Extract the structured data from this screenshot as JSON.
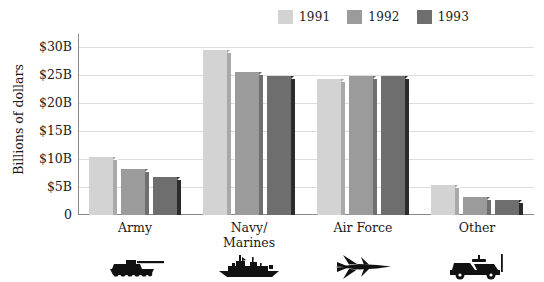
{
  "chart_data": {
    "type": "bar",
    "title": "",
    "subtitle": "",
    "xlabel": "",
    "ylabel": "Billions of dollars",
    "categories": [
      "Army",
      "Navy/\nMarines",
      "Air Force",
      "Other"
    ],
    "category_lines": [
      [
        "Army"
      ],
      [
        "Navy/",
        "Marines"
      ],
      [
        "Air Force"
      ],
      [
        "Other"
      ]
    ],
    "series": [
      {
        "name": "1991",
        "color": "#d3d3d3",
        "side_color": "#a9a9a9",
        "values": [
          10.3,
          29.4,
          24.2,
          5.4
        ]
      },
      {
        "name": "1992",
        "color": "#9b9b9b",
        "side_color": "#6f6f6f",
        "values": [
          8.2,
          25.4,
          24.7,
          3.2
        ]
      },
      {
        "name": "1993",
        "color": "#6e6e6e",
        "side_color": "#2b2b2b",
        "values": [
          6.8,
          24.8,
          24.8,
          2.7
        ]
      }
    ],
    "ylim": [
      0,
      31
    ],
    "yticks": [
      30,
      25,
      20,
      15,
      10,
      5,
      0
    ],
    "ytick_labels": [
      "$30B",
      "$25B",
      "$20B",
      "$15B",
      "$10B",
      "$5B",
      "0"
    ],
    "grid": true,
    "grid_axis": "y",
    "legend_position": "top-right",
    "category_icons": [
      "tank-icon",
      "battleship-icon",
      "fighter-jet-icon",
      "humvee-icon"
    ]
  },
  "legend": {
    "items": [
      {
        "label": "1991",
        "color": "#d3d3d3"
      },
      {
        "label": "1992",
        "color": "#9b9b9b"
      },
      {
        "label": "1993",
        "color": "#6e6e6e"
      }
    ]
  },
  "colors": {
    "background": "#ffffff",
    "axis": "#8a8a8a",
    "gridline": "#dedede",
    "text": "#1a1a1a",
    "series_1991": "#d3d3d3",
    "series_1992": "#9b9b9b",
    "series_1993": "#6e6e6e"
  }
}
